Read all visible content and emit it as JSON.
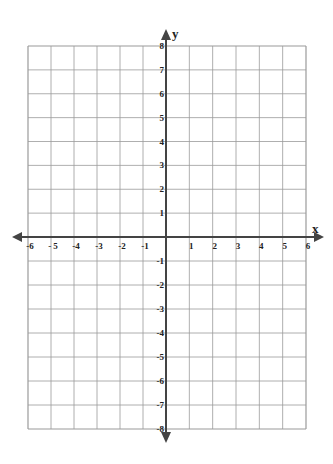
{
  "chart_data": {
    "type": "coordinate-grid",
    "title": "",
    "xlabel": "x",
    "ylabel": "y",
    "xlim": [
      -6,
      6
    ],
    "ylim": [
      -8,
      8
    ],
    "grid": true,
    "x_ticks": [
      "-6",
      "- 5",
      "-4",
      "-3",
      "-2",
      "-1",
      "1",
      "2",
      "3",
      "4",
      "5",
      "6"
    ],
    "y_ticks": [
      "8",
      "7",
      "6",
      "5",
      "4",
      "3",
      "2",
      "1",
      "-1",
      "-2",
      "-3",
      "-4",
      "-5",
      "-6",
      "-7",
      "-8"
    ]
  },
  "labels": {
    "x_axis": "x",
    "y_axis": "y"
  },
  "colors": {
    "grid": "#9a9a9a",
    "axis": "#444444",
    "text": "#222222"
  }
}
